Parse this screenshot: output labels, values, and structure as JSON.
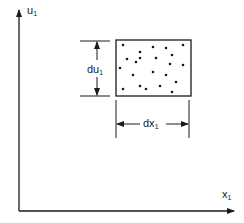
{
  "diagram": {
    "axes": {
      "y_label": "u",
      "y_label_sub": "1",
      "x_label": "x",
      "x_label_sub": "1"
    },
    "dimensions": {
      "height_label": "du",
      "height_label_sub": "1",
      "width_label": "dx",
      "width_label_sub": "1"
    },
    "box": {
      "x": 116,
      "y": 40,
      "width": 75,
      "height": 56,
      "dot_count": 22
    },
    "dots": [
      [
        123,
        45
      ],
      [
        153,
        47
      ],
      [
        166,
        48
      ],
      [
        183,
        45
      ],
      [
        140,
        52
      ],
      [
        127,
        59
      ],
      [
        140,
        58
      ],
      [
        136,
        62
      ],
      [
        156,
        58
      ],
      [
        172,
        55
      ],
      [
        170,
        64
      ],
      [
        183,
        65
      ],
      [
        120,
        68
      ],
      [
        133,
        75
      ],
      [
        153,
        72
      ],
      [
        166,
        75
      ],
      [
        176,
        82
      ],
      [
        140,
        86
      ],
      [
        146,
        89
      ],
      [
        160,
        86
      ],
      [
        123,
        89
      ],
      [
        172,
        92
      ]
    ],
    "colors": {
      "line": "#1a1a1a",
      "background": "#ffffff"
    }
  }
}
